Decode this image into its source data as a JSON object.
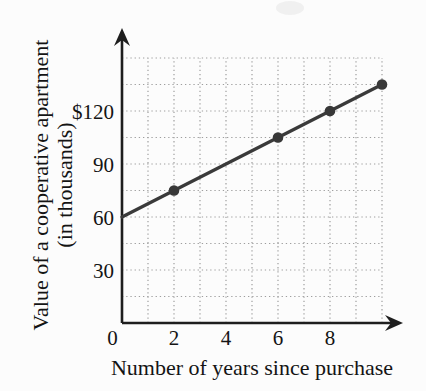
{
  "figure": {
    "background_color": "#fcfcfc",
    "x_axis_title": "Number of years since purchase",
    "y_axis_title_line1": "Value of a cooperative apartment",
    "y_axis_title_line2": "(in thousands)"
  },
  "chart_data": {
    "type": "line",
    "title": "",
    "xlabel": "Number of years since purchase",
    "ylabel": "Value of a cooperative apartment (in thousands)",
    "xlim": [
      0,
      10.7
    ],
    "ylim": [
      0,
      150
    ],
    "grid": "dotted",
    "x_gridline_step": 1,
    "x_gridline_max": 10,
    "y_gridline_step": 15,
    "y_gridline_max": 150,
    "line_endpoints": [
      {
        "x": 0,
        "y": 60
      },
      {
        "x": 10,
        "y": 135
      }
    ],
    "marker_points": [
      {
        "x": 2,
        "y": 75
      },
      {
        "x": 6,
        "y": 105
      },
      {
        "x": 8,
        "y": 120
      },
      {
        "x": 10,
        "y": 135
      }
    ],
    "x_tick_labels": [
      {
        "value": 0,
        "label": "0"
      },
      {
        "value": 2,
        "label": "2"
      },
      {
        "value": 4,
        "label": "4"
      },
      {
        "value": 6,
        "label": "6"
      },
      {
        "value": 8,
        "label": "8"
      }
    ],
    "y_tick_labels": [
      {
        "value": 30,
        "label": "30"
      },
      {
        "value": 60,
        "label": "60"
      },
      {
        "value": 90,
        "label": "90"
      },
      {
        "value": 120,
        "label": "$120"
      }
    ],
    "colors": {
      "line": "#3a3a3a",
      "marker": "#383838",
      "grid": "#9e9e9e",
      "axis": "#1e1e1e",
      "text": "#141414"
    }
  }
}
